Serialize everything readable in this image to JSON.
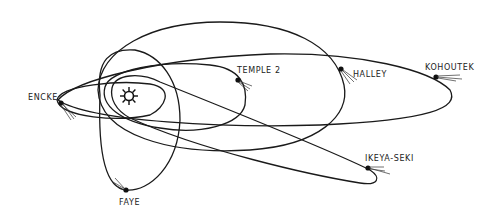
{
  "sun": {
    "name": "Sun",
    "icon": "sun-icon",
    "x": 129,
    "y": 96
  },
  "comets": [
    {
      "id": "encke",
      "label": "ENCKE",
      "x": 61,
      "y": 103
    },
    {
      "id": "temple2",
      "label": "TEMPLE 2",
      "x": 238,
      "y": 80
    },
    {
      "id": "halley",
      "label": "HALLEY",
      "x": 341,
      "y": 69
    },
    {
      "id": "kohoutek",
      "label": "KOHOUTEK",
      "x": 436,
      "y": 77
    },
    {
      "id": "ikeya-seki",
      "label": "IKEYA-SEKI",
      "x": 368,
      "y": 168
    },
    {
      "id": "faye",
      "label": "FAYE",
      "x": 126,
      "y": 190
    }
  ],
  "colors": {
    "ink": "#1a1a1a",
    "background": "#ffffff"
  }
}
